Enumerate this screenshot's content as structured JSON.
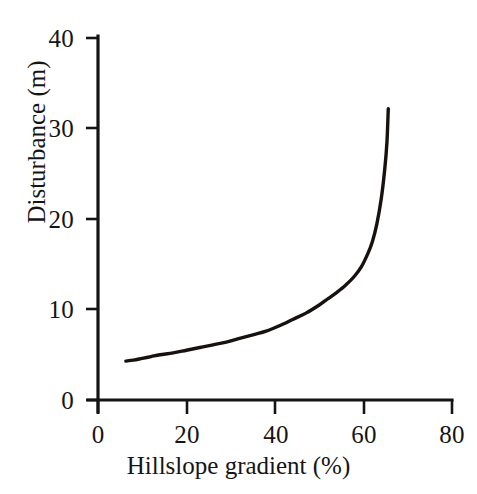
{
  "chart_data": {
    "type": "line",
    "title": "",
    "subtitle": "",
    "xlabel": "Hillslope gradient (%)",
    "ylabel": "Disturbance (m)",
    "xlim": [
      0,
      80
    ],
    "ylim": [
      0,
      40
    ],
    "xticks": [
      0,
      20,
      40,
      60,
      80
    ],
    "yticks": [
      0,
      10,
      20,
      30,
      40
    ],
    "xtick_labels": [
      "0",
      "20",
      "40",
      "60",
      "80"
    ],
    "ytick_labels": [
      "0",
      "10",
      "20",
      "30",
      "40"
    ],
    "grid": false,
    "legend": false,
    "legend_position": "none",
    "annotations": [],
    "series": [
      {
        "name": "Disturbance vs hillslope gradient",
        "color": "#17120f",
        "x": [
          6.3,
          8.0,
          10.0,
          12.0,
          14.0,
          17.0,
          20.0,
          23.0,
          26.0,
          29.0,
          32.0,
          35.0,
          38.0,
          41.0,
          44.0,
          47.0,
          50.0,
          52.0,
          54.0,
          56.0,
          58.0,
          59.5,
          61.0,
          62.0,
          63.0,
          64.0,
          64.8,
          65.3,
          65.6
        ],
        "y": [
          4.3,
          4.4,
          4.6,
          4.8,
          5.0,
          5.2,
          5.5,
          5.8,
          6.1,
          6.4,
          6.8,
          7.2,
          7.6,
          8.2,
          8.9,
          9.6,
          10.5,
          11.2,
          11.9,
          12.7,
          13.7,
          14.7,
          16.2,
          17.5,
          19.4,
          22.2,
          25.5,
          28.5,
          32.2
        ]
      }
    ]
  },
  "axes": {
    "x_title": "Hillslope gradient (%)",
    "y_title": "Disturbance (m)",
    "x_tick_labels": [
      "0",
      "20",
      "40",
      "60",
      "80"
    ],
    "y_tick_labels": [
      "0",
      "10",
      "20",
      "30",
      "40"
    ]
  },
  "style": {
    "line_color": "#17120f",
    "axis_color": "#141414",
    "background": "#ffffff"
  }
}
